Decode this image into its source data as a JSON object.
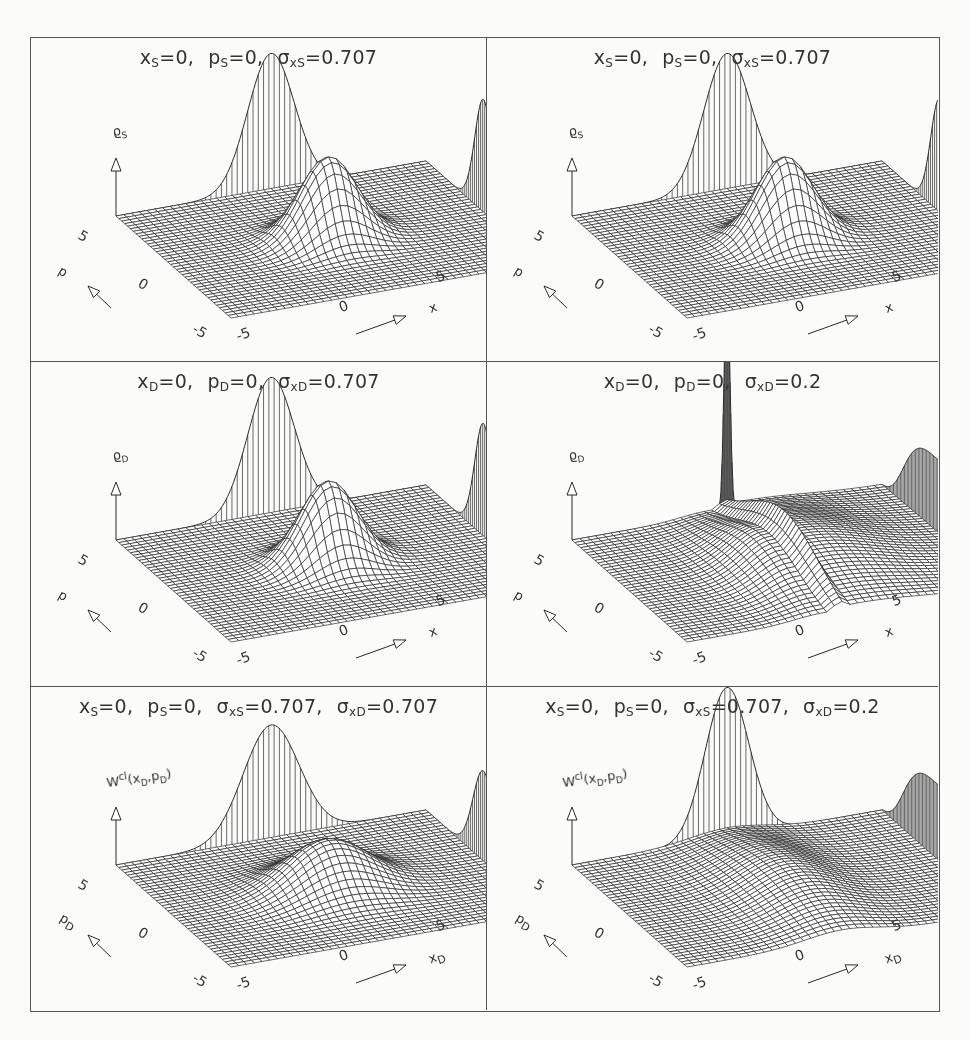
{
  "figure": {
    "layout": {
      "rows": 3,
      "cols": 2
    },
    "colors": {
      "line": "#2a2a2a",
      "frame": "#555555",
      "background": "#fbfbfa",
      "text": "#333333"
    }
  },
  "panels": [
    {
      "id": "top-left",
      "title_parts": [
        {
          "sym": "x",
          "sub": "S",
          "val": "=0,"
        },
        {
          "sym": "p",
          "sub": "S",
          "val": "=0,"
        },
        {
          "sym": "σ",
          "sub": "xS",
          "val": "=0.707"
        }
      ],
      "zlabel": {
        "base": "ϱ",
        "sub": "S",
        "sup": "",
        "args": ""
      },
      "xlabel": "x",
      "ylabel": "p",
      "x_ticks": [
        "-5",
        "0",
        "5"
      ],
      "y_ticks": [
        "-5",
        "0",
        "5"
      ],
      "surface": {
        "type": "gauss_peaks",
        "center_sigma": 0.707,
        "center_amp": 0.55,
        "spike": 0,
        "ridge": 0
      }
    },
    {
      "id": "top-right",
      "title_parts": [
        {
          "sym": "x",
          "sub": "S",
          "val": "=0,"
        },
        {
          "sym": "p",
          "sub": "S",
          "val": "=0,"
        },
        {
          "sym": "σ",
          "sub": "xS",
          "val": "=0.707"
        }
      ],
      "zlabel": {
        "base": "ϱ",
        "sub": "S",
        "sup": "",
        "args": ""
      },
      "xlabel": "x",
      "ylabel": "p",
      "x_ticks": [
        "-5",
        "0",
        "5"
      ],
      "y_ticks": [
        "-5",
        "0",
        "5"
      ],
      "surface": {
        "type": "gauss_peaks",
        "center_sigma": 0.707,
        "center_amp": 0.55,
        "spike": 0,
        "ridge": 0
      }
    },
    {
      "id": "middle-left",
      "title_parts": [
        {
          "sym": "x",
          "sub": "D",
          "val": "=0,"
        },
        {
          "sym": "p",
          "sub": "D",
          "val": "=0,"
        },
        {
          "sym": "σ",
          "sub": "xD",
          "val": "=0.707"
        }
      ],
      "zlabel": {
        "base": "ϱ",
        "sub": "D",
        "sup": "",
        "args": ""
      },
      "xlabel": "x",
      "ylabel": "p",
      "x_ticks": [
        "-5",
        "0",
        "5"
      ],
      "y_ticks": [
        "-5",
        "0",
        "5"
      ],
      "surface": {
        "type": "gauss_peaks",
        "center_sigma": 0.707,
        "center_amp": 0.55,
        "spike": 0,
        "ridge": 0
      }
    },
    {
      "id": "middle-right",
      "title_parts": [
        {
          "sym": "x",
          "sub": "D",
          "val": "=0,"
        },
        {
          "sym": "p",
          "sub": "D",
          "val": "=0,"
        },
        {
          "sym": "σ",
          "sub": "xD",
          "val": "=0.2"
        }
      ],
      "zlabel": {
        "base": "ϱ",
        "sub": "D",
        "sup": "",
        "args": ""
      },
      "xlabel": "x",
      "ylabel": "p",
      "x_ticks": [
        "-5",
        "0",
        "5"
      ],
      "y_ticks": [
        "-5",
        "0",
        "5"
      ],
      "surface": {
        "type": "ridge",
        "center_sigma": 0.2,
        "center_amp": 0,
        "spike": 1,
        "ridge": 1
      }
    },
    {
      "id": "bottom-left",
      "title_parts": [
        {
          "sym": "x",
          "sub": "S",
          "val": "=0,"
        },
        {
          "sym": "p",
          "sub": "S",
          "val": "=0,"
        },
        {
          "sym": "σ",
          "sub": "xS",
          "val": "=0.707,"
        },
        {
          "sym": "σ",
          "sub": "xD",
          "val": "=0.707"
        }
      ],
      "zlabel": {
        "base": "W",
        "sub": "",
        "sup": "cl",
        "args": "(x_D,p_D)"
      },
      "xlabel": "x_D",
      "ylabel": "p_D",
      "x_ticks": [
        "-5",
        "0",
        "5"
      ],
      "y_ticks": [
        "-5",
        "0",
        "5"
      ],
      "surface": {
        "type": "gauss_peaks",
        "center_sigma": 1.0,
        "center_amp": 0.32,
        "spike": 0,
        "ridge": 0
      }
    },
    {
      "id": "bottom-right",
      "title_parts": [
        {
          "sym": "x",
          "sub": "S",
          "val": "=0,"
        },
        {
          "sym": "p",
          "sub": "S",
          "val": "=0,"
        },
        {
          "sym": "σ",
          "sub": "xS",
          "val": "=0.707,"
        },
        {
          "sym": "σ",
          "sub": "xD",
          "val": "=0.2"
        }
      ],
      "zlabel": {
        "base": "W",
        "sub": "",
        "sup": "cl",
        "args": "(x_D,p_D)"
      },
      "xlabel": "x_D",
      "ylabel": "p_D",
      "x_ticks": [
        "-5",
        "0",
        "5"
      ],
      "y_ticks": [
        "-5",
        "0",
        "5"
      ],
      "surface": {
        "type": "soft_ridge",
        "center_sigma": 0.2,
        "center_amp": 0,
        "spike": 0,
        "ridge": 1
      }
    }
  ],
  "chart_data": [
    {
      "type": "surface",
      "title": "x_S=0, p_S=0, σ_xS=0.707",
      "xlabel": "x",
      "ylabel": "p",
      "zlabel": "ϱ_S",
      "xlim": [
        -5,
        5
      ],
      "ylim": [
        -5,
        5
      ],
      "grid": "wireframe",
      "features": [
        "central gaussian at (0,0)",
        "marginal projection peaks on back walls"
      ]
    },
    {
      "type": "surface",
      "title": "x_S=0, p_S=0, σ_xS=0.707",
      "xlabel": "x",
      "ylabel": "p",
      "zlabel": "ϱ_S",
      "xlim": [
        -5,
        5
      ],
      "ylim": [
        -5,
        5
      ],
      "grid": "wireframe",
      "features": [
        "central gaussian at (0,0)",
        "marginal projection peaks on back walls"
      ]
    },
    {
      "type": "surface",
      "title": "x_D=0, p_D=0, σ_xD=0.707",
      "xlabel": "x",
      "ylabel": "p",
      "zlabel": "ϱ_D",
      "xlim": [
        -5,
        5
      ],
      "ylim": [
        -5,
        5
      ],
      "grid": "wireframe",
      "features": [
        "central gaussian at (0,0)",
        "marginal projection peaks on back walls"
      ]
    },
    {
      "type": "surface",
      "title": "x_D=0, p_D=0, σ_xD=0.2",
      "xlabel": "x",
      "ylabel": "p",
      "zlabel": "ϱ_D",
      "xlim": [
        -5,
        5
      ],
      "ylim": [
        -5,
        5
      ],
      "grid": "wireframe",
      "features": [
        "narrow spike in x-marginal",
        "ridge along p at x=0",
        "broad p-marginal"
      ]
    },
    {
      "type": "surface",
      "title": "x_S=0, p_S=0, σ_xS=0.707, σ_xD=0.707",
      "xlabel": "x_D",
      "ylabel": "p_D",
      "zlabel": "W^cl(x_D,p_D)",
      "xlim": [
        -5,
        5
      ],
      "ylim": [
        -5,
        5
      ],
      "grid": "wireframe",
      "features": [
        "broad central gaussian",
        "marginal projection peaks"
      ]
    },
    {
      "type": "surface",
      "title": "x_S=0, p_S=0, σ_xS=0.707, σ_xD=0.2",
      "xlabel": "x_D",
      "ylabel": "p_D",
      "zlabel": "W^cl(x_D,p_D)",
      "xlim": [
        -5,
        5
      ],
      "ylim": [
        -5,
        5
      ],
      "grid": "wireframe",
      "features": [
        "low ridge along p_D at x_D=0",
        "x-marginal peak",
        "broad p-marginal"
      ]
    }
  ]
}
